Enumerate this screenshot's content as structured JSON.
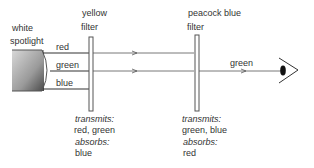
{
  "source": {
    "label_line1": "white",
    "label_line2": "spotlight"
  },
  "beams": {
    "red": "red",
    "green": "green",
    "blue": "blue",
    "output": "green"
  },
  "filter1": {
    "name_line1": "yellow",
    "name_line2": "filter",
    "transmits_label": "transmits:",
    "transmits_value": "red, green",
    "absorbs_label": "absorbs:",
    "absorbs_value": "blue"
  },
  "filter2": {
    "name_line1": "peacock blue",
    "name_line2": "filter",
    "transmits_label": "transmits:",
    "transmits_value": "green, blue",
    "absorbs_label": "absorbs:",
    "absorbs_value": "red"
  },
  "colors": {
    "line": "#444444",
    "spotlight_dark": "#555555",
    "spotlight_light": "#cfcfcf"
  }
}
